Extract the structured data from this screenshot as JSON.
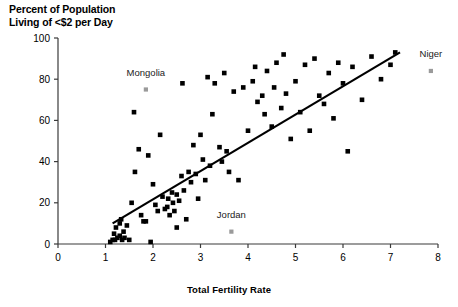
{
  "chart_data": {
    "type": "scatter",
    "title": "Percent of Population\nLiving of <$2 per Day",
    "xlabel": "Total Fertility Rate",
    "ylabel": "Percent of Population Living of <$2 per Day",
    "xlim": [
      0,
      8
    ],
    "ylim": [
      0,
      100
    ],
    "xticks": [
      0,
      1,
      2,
      3,
      4,
      5,
      6,
      7,
      8
    ],
    "yticks": [
      0,
      20,
      40,
      60,
      80,
      100
    ],
    "grid": false,
    "legend": "none",
    "marker_color": "#000000",
    "highlight_color": "#9a9a9a",
    "trendline": {
      "label": "linear fit",
      "x0": 1.15,
      "y0": 10,
      "x1": 7.2,
      "y1": 93,
      "color": "#000000",
      "width": 2.2
    },
    "annotations": [
      {
        "label": "Mongolia",
        "x": 1.85,
        "y": 75,
        "label_x": 1.85,
        "label_y": 83,
        "highlight": true
      },
      {
        "label": "Niger",
        "x": 7.85,
        "y": 84,
        "label_x": 7.85,
        "label_y": 92,
        "highlight": true
      },
      {
        "label": "Jordan",
        "x": 3.65,
        "y": 6,
        "label_x": 3.65,
        "label_y": 14,
        "highlight": true
      }
    ],
    "points": [
      [
        1.1,
        1
      ],
      [
        1.15,
        2
      ],
      [
        1.18,
        5
      ],
      [
        1.2,
        2
      ],
      [
        1.22,
        8
      ],
      [
        1.25,
        3
      ],
      [
        1.3,
        10
      ],
      [
        1.3,
        4
      ],
      [
        1.33,
        12
      ],
      [
        1.35,
        2
      ],
      [
        1.38,
        6
      ],
      [
        1.4,
        3
      ],
      [
        1.45,
        9
      ],
      [
        1.5,
        2
      ],
      [
        1.55,
        20
      ],
      [
        1.6,
        64
      ],
      [
        1.62,
        35
      ],
      [
        1.7,
        46
      ],
      [
        1.75,
        14
      ],
      [
        1.8,
        11
      ],
      [
        1.85,
        11
      ],
      [
        1.9,
        43
      ],
      [
        1.95,
        1
      ],
      [
        2.0,
        29
      ],
      [
        2.05,
        19
      ],
      [
        2.1,
        16
      ],
      [
        2.15,
        53
      ],
      [
        2.2,
        23
      ],
      [
        2.25,
        17
      ],
      [
        2.3,
        18
      ],
      [
        2.32,
        22
      ],
      [
        2.35,
        14
      ],
      [
        2.4,
        25
      ],
      [
        2.42,
        20
      ],
      [
        2.45,
        16
      ],
      [
        2.5,
        24
      ],
      [
        2.5,
        8
      ],
      [
        2.55,
        21
      ],
      [
        2.6,
        33
      ],
      [
        2.62,
        78
      ],
      [
        2.65,
        26
      ],
      [
        2.7,
        12
      ],
      [
        2.75,
        35
      ],
      [
        2.8,
        30
      ],
      [
        2.85,
        48
      ],
      [
        2.9,
        34
      ],
      [
        2.95,
        22
      ],
      [
        3.0,
        53
      ],
      [
        3.05,
        41
      ],
      [
        3.1,
        31
      ],
      [
        3.15,
        81
      ],
      [
        3.2,
        38
      ],
      [
        3.25,
        63
      ],
      [
        3.3,
        78
      ],
      [
        3.4,
        47
      ],
      [
        3.45,
        40
      ],
      [
        3.5,
        83
      ],
      [
        3.55,
        45
      ],
      [
        3.6,
        35
      ],
      [
        3.7,
        74
      ],
      [
        3.8,
        31
      ],
      [
        3.9,
        76
      ],
      [
        4.0,
        55
      ],
      [
        4.1,
        79
      ],
      [
        4.15,
        86
      ],
      [
        4.2,
        69
      ],
      [
        4.3,
        72
      ],
      [
        4.35,
        63
      ],
      [
        4.4,
        84
      ],
      [
        4.5,
        57
      ],
      [
        4.55,
        76
      ],
      [
        4.6,
        88
      ],
      [
        4.7,
        66
      ],
      [
        4.75,
        92
      ],
      [
        4.8,
        73
      ],
      [
        4.9,
        51
      ],
      [
        5.0,
        79
      ],
      [
        5.1,
        64
      ],
      [
        5.2,
        87
      ],
      [
        5.3,
        55
      ],
      [
        5.4,
        90
      ],
      [
        5.5,
        72
      ],
      [
        5.6,
        68
      ],
      [
        5.7,
        83
      ],
      [
        5.8,
        61
      ],
      [
        5.9,
        88
      ],
      [
        6.0,
        78
      ],
      [
        6.1,
        45
      ],
      [
        6.2,
        86
      ],
      [
        6.4,
        70
      ],
      [
        6.6,
        91
      ],
      [
        6.8,
        80
      ],
      [
        7.0,
        87
      ],
      [
        7.1,
        93
      ]
    ]
  }
}
